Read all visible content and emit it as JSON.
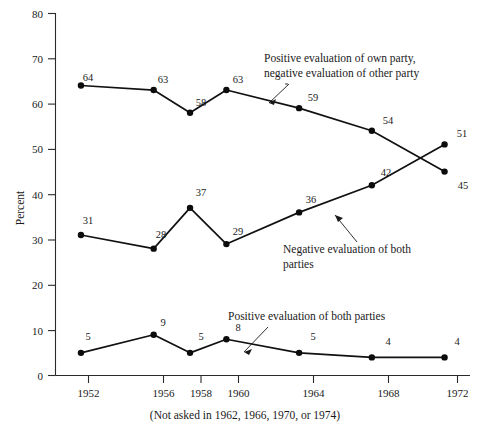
{
  "chart_data": {
    "type": "line",
    "title": "",
    "subtitle": "",
    "xlabel": "",
    "ylabel": "Percent",
    "xlim": [
      1950.6,
      1973.4
    ],
    "ylim": [
      0,
      80
    ],
    "grid": false,
    "legend_position": "inline-annotations",
    "x": [
      1952,
      1956,
      1958,
      1960,
      1964,
      1968,
      1972
    ],
    "categories": [
      "1952",
      "1956",
      "1958",
      "1960",
      "1964",
      "1968",
      "1972"
    ],
    "y_ticks": [
      0,
      10,
      20,
      30,
      40,
      50,
      60,
      70,
      80
    ],
    "y_tick_labels": [
      "0",
      "10",
      "20",
      "30",
      "40",
      "50",
      "60",
      "70",
      "80"
    ],
    "x_tick_labels": [
      "1952",
      "1956",
      "1958",
      "1960",
      "1964",
      "1968",
      "1972"
    ],
    "series": [
      {
        "name": "Positive evaluation of own party, negative evaluation of other party",
        "values": [
          64,
          63,
          58,
          63,
          59,
          54,
          45
        ],
        "labels": [
          "64",
          "63",
          "58",
          "63",
          "59",
          "54",
          "45"
        ]
      },
      {
        "name": "Negative evaluation of both parties",
        "values": [
          31,
          28,
          37,
          29,
          36,
          42,
          51
        ],
        "labels": [
          "31",
          "28",
          "37",
          "29",
          "36",
          "42",
          "51"
        ]
      },
      {
        "name": "Positive evaluation of both parties",
        "values": [
          5,
          9,
          5,
          8,
          5,
          4,
          4
        ],
        "labels": [
          "5",
          "9",
          "5",
          "8",
          "5",
          "4",
          "4"
        ]
      }
    ],
    "annotations": [
      {
        "id": "annot-own-party",
        "line1": "Positive evaluation of own party,",
        "line2": "negative evaluation of other party"
      },
      {
        "id": "annot-negative-both",
        "line1": "Negative evaluation of both",
        "line2": "parties"
      },
      {
        "id": "annot-positive-both",
        "line1": "Positive evaluation of both parties",
        "line2": ""
      }
    ],
    "footnote": "(Not asked in 1962, 1966, 1970, or 1974)",
    "colors": {
      "line": "#111111",
      "marker": "#0c0c0c",
      "axis": "#2a2a2a",
      "text": "#1a1a1a",
      "background": "#ffffff"
    }
  },
  "axis": {
    "ylabel": "Percent"
  },
  "point_labels": {
    "s0": [
      "64",
      "63",
      "58",
      "63",
      "59",
      "54",
      "45"
    ],
    "s1": [
      "31",
      "28",
      "37",
      "29",
      "36",
      "42",
      "51"
    ],
    "s2": [
      "5",
      "9",
      "5",
      "8",
      "5",
      "4",
      "4"
    ]
  },
  "y_tick_labels": [
    "80",
    "70",
    "60",
    "50",
    "40",
    "30",
    "20",
    "10",
    "0"
  ],
  "x_tick_labels": [
    "1952",
    "1956",
    "1958",
    "1960",
    "1964",
    "1968",
    "1972"
  ],
  "annotations": {
    "own_party_l1": "Positive evaluation of own party,",
    "own_party_l2": "negative evaluation of other party",
    "negative_both_l1": "Negative evaluation of both",
    "negative_both_l2": "parties",
    "positive_both_l1": "Positive evaluation of both parties"
  },
  "footnote": "(Not asked in 1962, 1966, 1970, or 1974)"
}
